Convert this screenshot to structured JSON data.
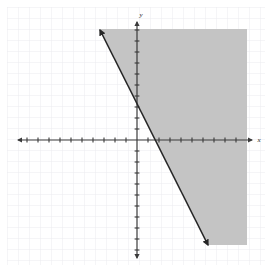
{
  "figure": {
    "title": "",
    "width": 272,
    "height": 272,
    "background_color": "#ffffff"
  },
  "axes": {
    "x_label": "x",
    "y_label": "y",
    "x_label_position": "right-end",
    "y_label_position": "top-end",
    "axis_color": "#3a3a3a",
    "arrows": "both-ends",
    "origin_px": {
      "x": 137,
      "y": 140
    },
    "unit_px": 11,
    "x_axis_pixel_span": {
      "from": 18,
      "to": 252
    },
    "y_axis_pixel_span": {
      "from": 22,
      "to": 258
    },
    "tick_marks": true,
    "tick_count_left": 10,
    "tick_count_right": 9,
    "tick_count_up": 10,
    "tick_count_down": 10
  },
  "grid": {
    "visible": true,
    "color": "#ececf0",
    "spacing_px": 11,
    "offset_px": 7,
    "style": "light-square-grid"
  },
  "chart_data": {
    "type": "line",
    "title": "",
    "xlabel": "x",
    "ylabel": "y",
    "xlim": [
      -11,
      10
    ],
    "ylim": [
      -10,
      10
    ],
    "grid": true,
    "legend": false,
    "series": [
      {
        "name": "boundary-line",
        "kind": "line",
        "equation": "y = -2x + 3",
        "slope": -2,
        "y_intercept": 3,
        "x_intercept": 1.5,
        "style": "solid",
        "color": "#262626",
        "width_px": 1.6,
        "arrow_both_ends": true,
        "endpoints_px": [
          {
            "x": 100,
            "y": 30
          },
          {
            "x": 208,
            "y": 245
          }
        ],
        "points": [
          {
            "x": -3.4,
            "y": 9.9
          },
          {
            "x": 0,
            "y": 3
          },
          {
            "x": 1.5,
            "y": 0
          },
          {
            "x": 6.4,
            "y": -9.5
          }
        ]
      },
      {
        "name": "shaded-region",
        "kind": "inequality-shading",
        "inequality": "y >= -2x + 3",
        "region": "right-of-line",
        "fill_color": "#c4c4c4",
        "opacity": 1,
        "polygon_px": [
          {
            "x": 100,
            "y": 29
          },
          {
            "x": 247,
            "y": 29
          },
          {
            "x": 247,
            "y": 245
          },
          {
            "x": 208,
            "y": 245
          }
        ]
      }
    ],
    "annotations": []
  },
  "colors": {
    "shading": "#c4c4c4",
    "line": "#262626",
    "axis": "#3a3a3a",
    "grid": "#ececf0",
    "background": "#ffffff"
  }
}
